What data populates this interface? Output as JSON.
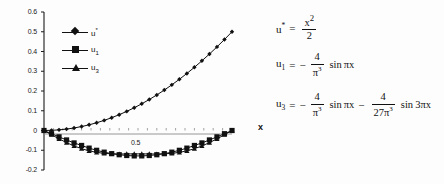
{
  "figure": {
    "name": "approximation-plot",
    "background": "#fdfdfd",
    "ink_color": "#111111"
  },
  "chart_data": {
    "type": "line",
    "title": "",
    "xlabel": "x",
    "ylabel": "",
    "xlim": [
      0,
      1
    ],
    "ylim": [
      -0.2,
      0.6
    ],
    "grid": false,
    "legend_position": "upper-left-inside",
    "x_tick_labels": [
      "0.5"
    ],
    "x_tick_values": [
      0.5
    ],
    "y_tick_labels": [
      "0.6",
      "0.5",
      "0.4",
      "0.3",
      "0.2",
      "0.1",
      "0",
      "-0.1",
      "-0.2"
    ],
    "y_tick_values": [
      0.6,
      0.5,
      0.4,
      0.3,
      0.2,
      0.1,
      0,
      -0.1,
      -0.2
    ],
    "x": [
      0,
      0.04,
      0.08,
      0.12,
      0.16,
      0.2,
      0.24,
      0.28,
      0.32,
      0.36,
      0.4,
      0.44,
      0.48,
      0.52,
      0.56,
      0.6,
      0.64,
      0.68,
      0.72,
      0.76,
      0.8,
      0.84,
      0.88,
      0.92,
      0.96,
      1
    ],
    "series": [
      {
        "name": "u*",
        "marker": "diamond",
        "values": [
          0,
          0.0008,
          0.0032,
          0.0072,
          0.0128,
          0.02,
          0.0288,
          0.0392,
          0.0512,
          0.0648,
          0.08,
          0.0968,
          0.1152,
          0.1352,
          0.1568,
          0.18,
          0.2048,
          0.2312,
          0.2592,
          0.2888,
          0.32,
          0.3528,
          0.3872,
          0.4232,
          0.4608,
          0.5
        ]
      },
      {
        "name": "u1",
        "marker": "square",
        "values": [
          0,
          -0.0162,
          -0.0322,
          -0.0479,
          -0.0629,
          -0.0758,
          -0.0893,
          -0.1003,
          -0.1097,
          -0.1173,
          -0.1227,
          -0.1266,
          -0.1286,
          -0.1286,
          -0.1266,
          -0.1227,
          -0.1173,
          -0.1097,
          -0.1003,
          -0.0893,
          -0.0758,
          -0.0629,
          -0.0479,
          -0.0322,
          -0.0162,
          0
        ]
      },
      {
        "name": "u3",
        "marker": "triangle",
        "values": [
          0,
          -0.0215,
          -0.0422,
          -0.0614,
          -0.0782,
          -0.0922,
          -0.1031,
          -0.1108,
          -0.1157,
          -0.1182,
          -0.119,
          -0.1188,
          -0.1184,
          -0.1184,
          -0.1188,
          -0.119,
          -0.1182,
          -0.1157,
          -0.1108,
          -0.1031,
          -0.0922,
          -0.0782,
          -0.0614,
          -0.0422,
          -0.0215,
          0
        ]
      }
    ],
    "annotations": []
  },
  "legend": {
    "items": [
      {
        "label": "u",
        "sup": "*",
        "sub": "",
        "marker": "diamond"
      },
      {
        "label": "u",
        "sup": "",
        "sub": "1",
        "marker": "square"
      },
      {
        "label": "u",
        "sup": "",
        "sub": "3",
        "marker": "triangle"
      }
    ]
  },
  "axis": {
    "x_name": "x"
  },
  "equations": {
    "eq1": {
      "lhs": "u",
      "lhs_sup": "*",
      "lhs_sub": "",
      "eq": "=",
      "frac_num": "x",
      "frac_num_sup": "2",
      "frac_den": "2"
    },
    "eq2": {
      "lhs": "u",
      "lhs_sub": "1",
      "eq": "=",
      "sign": "−",
      "frac_num": "4",
      "frac_den": "π",
      "frac_den_sup": "3",
      "trig": "sin",
      "trig_arg": "πx"
    },
    "eq3": {
      "lhs": "u",
      "lhs_sub": "3",
      "eq": "=",
      "sign1": "−",
      "frac1_num": "4",
      "frac1_den": "π",
      "frac1_den_sup": "3",
      "trig1": "sin",
      "trig1_arg": "πx",
      "sign2": "−",
      "frac2_num": "4",
      "frac2_den": "27π",
      "frac2_den_sup": "3",
      "trig2": "sin",
      "trig2_arg": "3πx"
    }
  }
}
